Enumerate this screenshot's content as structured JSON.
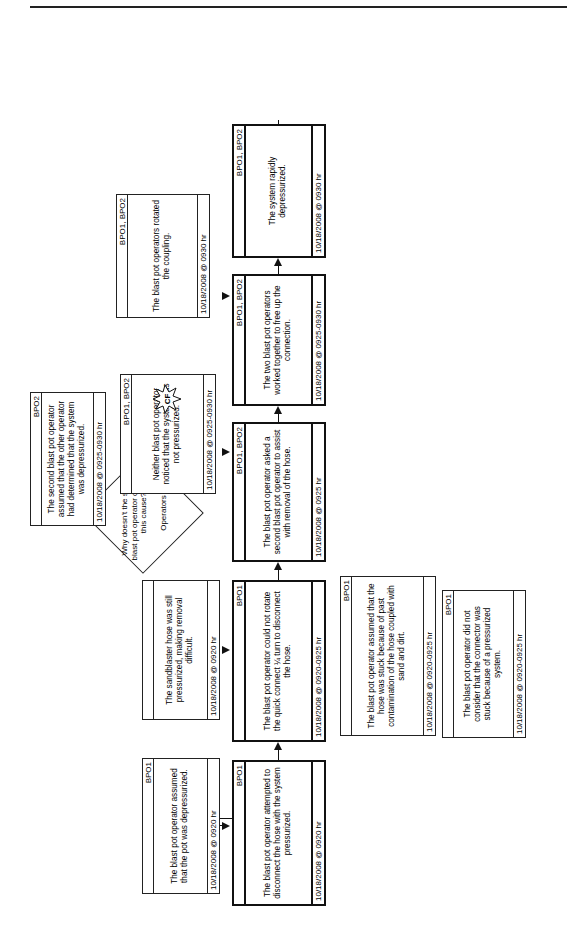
{
  "page_header": {
    "text": "... ying ..."
  },
  "start_marker": {
    "label": "A"
  },
  "nodes": {
    "n1": {
      "who": "BPO1",
      "text": "The blast pot operator attempted to disconnect the hose with the system pressurized.",
      "when": "10/18/2008 @ 0920 hr",
      "style": "primary"
    },
    "n1c": {
      "who": "BPO1",
      "text": "The blast pot operator assumed that the pot was depressurized.",
      "when": "10/18/2008 @ 0920 hr",
      "style": "condition"
    },
    "n2": {
      "who": "BPO1",
      "text": "The blast pot operator could not rotate the quick connect ¼ turn to disconnect the hose.",
      "when": "10/18/2008 @ 0920-0925 hr",
      "style": "primary"
    },
    "n2c": {
      "who": "",
      "text": "The sandblaster hose was still pressurized, making removal difficult.",
      "when": "10/18/2008 @ 0920 hr",
      "style": "condition"
    },
    "n2d1": {
      "who": "BPO1",
      "text": "The blast pot operator assumed that the hose was stuck because of past contamination of the hose coupled with sand and dirt.",
      "when": "10/18/2008 @ 0920-0925 hr",
      "style": "condition"
    },
    "n2d2": {
      "who": "BPO1",
      "text": "The blast pot operator did not consider that the connector was stuck because of a pressurized system.",
      "when": "10/18/2008 @ 0920-0925 hr",
      "style": "condition"
    },
    "n3": {
      "who": "BPO1, BPO2",
      "text": "The blast pot operator asked a second blast pot operator to assist with removal of the hose.",
      "when": "10/18/2008 @ 0925 hr",
      "style": "primary"
    },
    "n4": {
      "who": "BPO1, BPO2",
      "text": "The two blast pot operators worked together to free up the connection.",
      "when": "10/18/2008 @ 0925-0930 hr",
      "style": "primary"
    },
    "n4c": {
      "who": "BPO1, BPO2",
      "text": "Neither blast pot operator noticed that the system was not pressurized.",
      "when": "10/18/2008 @ 0925-0930 hr",
      "style": "condition"
    },
    "n4cc": {
      "who": "BPO2",
      "text": "The second blast pot operator assumed that the other operator had determined that the system was depressurized.",
      "when": "10/18/2008 @ 0925-0930 hr",
      "style": "condition"
    },
    "n5": {
      "who": "BPO1, BPO2",
      "text": "The system rapidly depressurized.",
      "when": "10/18/2008 @ 0930 hr",
      "style": "primary"
    },
    "n5c": {
      "who": "BPO1, BPO2",
      "text": "The blast pot operators rotated the coupling.",
      "when": "10/18/2008 @ 0930 hr",
      "style": "condition"
    },
    "n6": {
      "who": "BPO1, BPO2",
      "text": "Sand was sprayed onto the hands of the first blast pot operator.",
      "when": "10/18/2008 @ 0930 hr",
      "style": "primary"
    },
    "n7": {
      "who": "BPO1",
      "text": "The first blast pot operator's hand was cut by spraying sand.",
      "when": "10/18/2008 @ 0930 hr",
      "style": "terminal"
    },
    "n7d1": {
      "who": "BPO1, BPO2, NO",
      "text": "None of the operators were wearing eye protection.",
      "when": "10/18/2008 @ 0930 hr",
      "style": "condition"
    },
    "n7d2": {
      "who": "BPO1, BPO2, NO",
      "text": "The operators did not suffer any eye injuries, even though none of them were wearing eye protection as required by company policy.",
      "when": "10/18/2008 @ 0930 hr",
      "style": "condition"
    }
  },
  "question": {
    "text": "Why doesn't the second blast pot operator question this cause?",
    "answer": "Operators"
  },
  "markers": {
    "cf": "CF",
    "ion": "ION"
  },
  "colors": {
    "line": "#111111",
    "terminal_fill": "#111111",
    "terminal_text": "#ffffff"
  }
}
